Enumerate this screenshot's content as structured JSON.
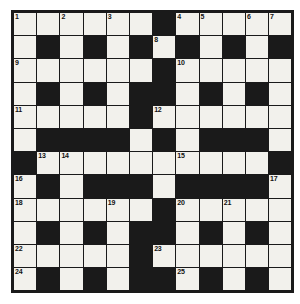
{
  "puzzle": {
    "title": "Crossword Grid",
    "rows": 12,
    "cols": 12,
    "colors": {
      "block": "#1a1a1a",
      "open": "#f2f1ec",
      "border": "#1a1a1a",
      "number": "#111111",
      "page_background": "#ffffff"
    },
    "grid": [
      [
        "1",
        "",
        "2",
        "",
        "3",
        "",
        "#",
        "4",
        "5",
        "",
        "6",
        "7"
      ],
      [
        "",
        "#",
        "",
        "#",
        "",
        "#",
        "8",
        "#",
        "",
        "#",
        "",
        "#"
      ],
      [
        "9",
        "",
        "",
        "",
        "",
        "",
        "#",
        "10",
        "",
        "",
        "",
        ""
      ],
      [
        "",
        "#",
        "",
        "#",
        "",
        "#",
        "#",
        "",
        "#",
        "",
        "#",
        ""
      ],
      [
        "11",
        "",
        "",
        "",
        "",
        "#",
        "12",
        "",
        "",
        "",
        "",
        ""
      ],
      [
        "",
        "#",
        "#",
        "#",
        "#",
        "",
        "#",
        "",
        "#",
        "#",
        "#",
        ""
      ],
      [
        "#",
        "13",
        "14",
        "",
        "",
        "",
        "#",
        "15",
        "",
        "",
        "",
        "#"
      ],
      [
        "16",
        "#",
        "",
        "#",
        "#",
        "#",
        "",
        "#",
        "#",
        "#",
        "#",
        "17"
      ],
      [
        "18",
        "",
        "",
        "",
        "19",
        "",
        "",
        "20",
        "",
        "21",
        "",
        ""
      ],
      [
        "",
        "#",
        "",
        "#",
        "",
        "#",
        "#",
        "",
        "#",
        "",
        "#",
        ""
      ],
      [
        "22",
        "",
        "",
        "",
        "",
        "#",
        "23",
        "",
        "",
        "",
        "",
        ""
      ],
      [
        "",
        "#",
        "",
        "#",
        "",
        "#",
        "#",
        "",
        "#",
        "",
        "#",
        ""
      ],
      [
        "24",
        "",
        "",
        "",
        "",
        "",
        "#",
        "25",
        "",
        "",
        "",
        ""
      ]
    ],
    "numbers": [
      {
        "n": "1",
        "row": 0,
        "col": 0
      },
      {
        "n": "2",
        "row": 0,
        "col": 2
      },
      {
        "n": "3",
        "row": 0,
        "col": 4
      },
      {
        "n": "4",
        "row": 0,
        "col": 7
      },
      {
        "n": "5",
        "row": 0,
        "col": 8
      },
      {
        "n": "6",
        "row": 0,
        "col": 10
      },
      {
        "n": "7",
        "row": 0,
        "col": 11
      },
      {
        "n": "8",
        "row": 1,
        "col": 6
      },
      {
        "n": "9",
        "row": 2,
        "col": 0
      },
      {
        "n": "10",
        "row": 2,
        "col": 7
      },
      {
        "n": "11",
        "row": 4,
        "col": 0
      },
      {
        "n": "12",
        "row": 4,
        "col": 6
      },
      {
        "n": "13",
        "row": 6,
        "col": 1
      },
      {
        "n": "14",
        "row": 6,
        "col": 2
      },
      {
        "n": "15",
        "row": 6,
        "col": 7
      },
      {
        "n": "16",
        "row": 7,
        "col": 0
      },
      {
        "n": "17",
        "row": 7,
        "col": 11
      },
      {
        "n": "18",
        "row": 8,
        "col": 0
      },
      {
        "n": "19",
        "row": 8,
        "col": 4
      },
      {
        "n": "20",
        "row": 8,
        "col": 7
      },
      {
        "n": "21",
        "row": 8,
        "col": 9
      },
      {
        "n": "22",
        "row": 10,
        "col": 0
      },
      {
        "n": "23",
        "row": 10,
        "col": 6
      },
      {
        "n": "24",
        "row": 11,
        "col": 0
      },
      {
        "n": "25",
        "row": 11,
        "col": 7
      }
    ],
    "blocks": [
      {
        "row": 0,
        "col": 6
      },
      {
        "row": 1,
        "col": 1
      },
      {
        "row": 1,
        "col": 3
      },
      {
        "row": 1,
        "col": 5
      },
      {
        "row": 1,
        "col": 7
      },
      {
        "row": 1,
        "col": 9
      },
      {
        "row": 1,
        "col": 11
      },
      {
        "row": 2,
        "col": 6
      },
      {
        "row": 3,
        "col": 1
      },
      {
        "row": 3,
        "col": 3
      },
      {
        "row": 3,
        "col": 5
      },
      {
        "row": 3,
        "col": 6
      },
      {
        "row": 3,
        "col": 8
      },
      {
        "row": 3,
        "col": 10
      },
      {
        "row": 4,
        "col": 5
      },
      {
        "row": 5,
        "col": 1
      },
      {
        "row": 5,
        "col": 2
      },
      {
        "row": 5,
        "col": 3
      },
      {
        "row": 5,
        "col": 4
      },
      {
        "row": 5,
        "col": 6
      },
      {
        "row": 5,
        "col": 8
      },
      {
        "row": 5,
        "col": 9
      },
      {
        "row": 5,
        "col": 10
      },
      {
        "row": 6,
        "col": 0
      },
      {
        "row": 6,
        "col": 11
      },
      {
        "row": 7,
        "col": 1
      },
      {
        "row": 7,
        "col": 3
      },
      {
        "row": 7,
        "col": 4
      },
      {
        "row": 7,
        "col": 5
      },
      {
        "row": 7,
        "col": 7
      },
      {
        "row": 7,
        "col": 8
      },
      {
        "row": 7,
        "col": 9
      },
      {
        "row": 7,
        "col": 10
      },
      {
        "row": 8,
        "col": 6
      },
      {
        "row": 9,
        "col": 1
      },
      {
        "row": 9,
        "col": 3
      },
      {
        "row": 9,
        "col": 5
      },
      {
        "row": 9,
        "col": 6
      },
      {
        "row": 9,
        "col": 8
      },
      {
        "row": 9,
        "col": 10
      },
      {
        "row": 10,
        "col": 5
      },
      {
        "row": 11,
        "col": 1
      },
      {
        "row": 11,
        "col": 3
      },
      {
        "row": 11,
        "col": 5
      },
      {
        "row": 11,
        "col": 6
      },
      {
        "row": 11,
        "col": 8
      },
      {
        "row": 11,
        "col": 10
      }
    ]
  }
}
